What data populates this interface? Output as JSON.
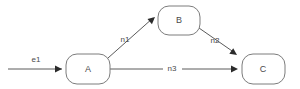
{
  "diagram": {
    "type": "directed-graph",
    "canvas": {
      "width": 300,
      "height": 89,
      "background": "#ffffff"
    },
    "colors": {
      "node_stroke": "#7c7c7c",
      "node_fill": "#ffffff",
      "edge_stroke": "#5a5a5a",
      "arrow_fill": "#2b2b2b",
      "label_text": "#4a4a4a"
    },
    "nodes": [
      {
        "id": "A",
        "label": "A",
        "x": 66,
        "y": 54,
        "w": 44,
        "h": 30,
        "cx": 88,
        "cy": 69,
        "rx": 11
      },
      {
        "id": "B",
        "label": "B",
        "x": 158,
        "y": 6,
        "w": 42,
        "h": 29,
        "cx": 179,
        "cy": 20,
        "rx": 11
      },
      {
        "id": "C",
        "label": "C",
        "x": 242,
        "y": 54,
        "w": 43,
        "h": 30,
        "cx": 263,
        "cy": 69,
        "rx": 11
      }
    ],
    "edges": [
      {
        "id": "e1",
        "label": "e1",
        "from": "",
        "to": "A",
        "path": "M 8 69 L 62 69",
        "arrow": {
          "x": 62,
          "y": 69,
          "angle": 0
        },
        "label_x": 36,
        "label_y": 60
      },
      {
        "id": "n1",
        "label": "n1",
        "from": "A",
        "to": "B",
        "path": "M 108 58 L 153 18",
        "arrow": {
          "x": 155,
          "y": 17,
          "angle": -41
        },
        "label_x": 125,
        "label_y": 40
      },
      {
        "id": "n2",
        "label": "n2",
        "from": "B",
        "to": "C",
        "path": "M 199 28 L 235 53",
        "arrow": {
          "x": 237,
          "y": 55,
          "angle": 35
        },
        "label_x": 215,
        "label_y": 41
      },
      {
        "id": "n3",
        "label": "n3",
        "from": "A",
        "to": "C",
        "path_left": "M 110 69 L 163 69",
        "path_right": "M 182 69 L 236 69",
        "arrow": {
          "x": 238,
          "y": 69,
          "angle": 0
        },
        "label_x": 172,
        "label_y": 69
      }
    ]
  }
}
